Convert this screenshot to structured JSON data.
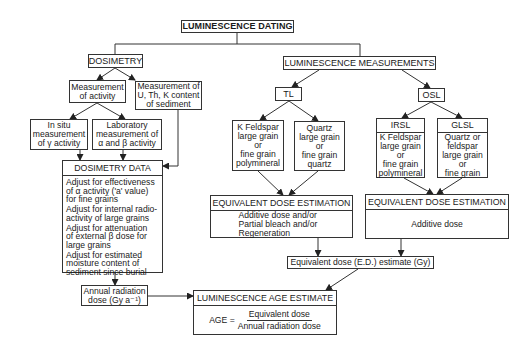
{
  "title": "LUMINESCENCE DATING",
  "dosimetry": {
    "label": "DOSIMETRY",
    "measurement_activity": "Measurement\nof activity",
    "measurement_activity_lines": [
      "Measurement",
      "of activity"
    ],
    "measurement_utk_lines": [
      "Measurement of",
      "U, Th, K content",
      "of sediment"
    ],
    "in_situ_lines": [
      "In situ",
      "measurement",
      "of γ activity"
    ],
    "laboratory_lines": [
      "Laboratory",
      "measurement  of",
      "α and β activity"
    ],
    "data": {
      "header": "DOSIMETRY DATA",
      "items": [
        [
          "Adjust for effectiveness",
          "of α activity ('a' value)",
          "for fine grains"
        ],
        [
          "Adjust for internal radio-",
          "activity of large grains"
        ],
        [
          "Adjust for attenuation",
          "of external β dose for",
          "large grains"
        ],
        [
          "Adjust for estimated",
          "moisture content of",
          "sediment since burial"
        ]
      ]
    },
    "annual_dose_lines": [
      "Annual radiation",
      "dose (Gy a⁻¹)"
    ]
  },
  "measurements": {
    "label": "LUMINESCENCE MEASUREMENTS",
    "tl": {
      "label": "TL",
      "feldspar_lines": [
        "K Feldspar",
        "large grain",
        "or",
        "fine grain",
        "polymineral"
      ],
      "quartz_lines": [
        "Quartz",
        "large grain",
        "or",
        "fine grain",
        "quartz"
      ],
      "ede_header": "EQUIVALENT DOSE ESTIMATION",
      "ede_lines": [
        "Additive dose and/or",
        "Partial bleach and/or",
        "Regeneration"
      ]
    },
    "osl": {
      "label": "OSL",
      "irsl": {
        "header": "IRSL",
        "lines": [
          "K Feldspar",
          "large grain",
          "or",
          "fine grain",
          "polymineral"
        ]
      },
      "glsl": {
        "header": "GLSL",
        "lines": [
          "Quartz or",
          "feldspar",
          "large grain",
          "or",
          "fine grain"
        ]
      },
      "ede_header": "EQUIVALENT DOSE ESTIMATION",
      "ede_lines": [
        "Additive dose"
      ]
    },
    "ed_estimate": "Equivalent dose (E.D.) estimate (Gy)"
  },
  "age": {
    "header": "LUMINESCENCE AGE ESTIMATE",
    "lhs": "AGE =",
    "numerator": "Equivalent dose",
    "denominator": "Annual radiation dose"
  }
}
